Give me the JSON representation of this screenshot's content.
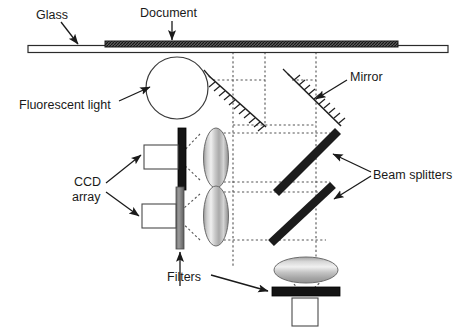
{
  "diagram": {
    "labels": {
      "glass": "Glass",
      "document": "Document",
      "fluorescent_light": "Fluorescent light",
      "mirror": "Mirror",
      "beam_splitters": "Beam splitters",
      "ccd_line1": "CCD",
      "ccd_line2": "array",
      "filters": "Filters"
    },
    "colors": {
      "ink": "#1a1a1a",
      "stroke": "#333333",
      "document_fill": "#4a4a4a",
      "beam_splitter_fill": "#1c1c1c",
      "filter_dark": "#141414",
      "filter_gray": "#7d7d7d",
      "lens_light": "#f2f2f2",
      "lens_mid": "#b9b9b9",
      "lens_dark": "#8f8f8f",
      "glass_fill": "#ffffff",
      "ccd_fill": "#ffffff",
      "ray_dotted": "#5a5a5a"
    },
    "components": [
      {
        "name": "glass-plate",
        "label": "Glass"
      },
      {
        "name": "document-sheet",
        "label": "Document"
      },
      {
        "name": "fluorescent-lamp",
        "label": "Fluorescent light"
      },
      {
        "name": "mirror-left",
        "label": "Mirror"
      },
      {
        "name": "mirror-right",
        "label": "Mirror"
      },
      {
        "name": "beam-splitter-upper",
        "label": "Beam splitters"
      },
      {
        "name": "beam-splitter-lower",
        "label": "Beam splitters"
      },
      {
        "name": "lens-upper",
        "label": "Lens"
      },
      {
        "name": "lens-lower",
        "label": "Lens"
      },
      {
        "name": "lens-bottom",
        "label": "Lens"
      },
      {
        "name": "filter-upper",
        "label": "Filters"
      },
      {
        "name": "filter-lower",
        "label": "Filters"
      },
      {
        "name": "filter-bottom",
        "label": "Filters"
      },
      {
        "name": "ccd-array-upper",
        "label": "CCD array"
      },
      {
        "name": "ccd-array-lower",
        "label": "CCD array"
      },
      {
        "name": "ccd-array-bottom",
        "label": "CCD array"
      }
    ]
  }
}
